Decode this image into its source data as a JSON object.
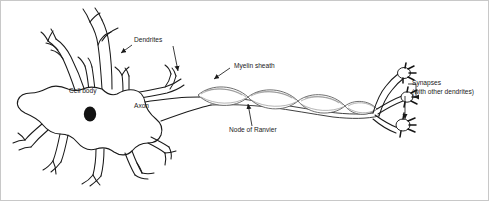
{
  "diagram": {
    "background_color": "#ffffff",
    "border_color": "#c8c8c8",
    "line_color": "#1a1a1a",
    "myelin_color": "#555555",
    "nucleus_color": "#121212",
    "width": 489,
    "height": 201
  },
  "labels": {
    "dendrites": "Dendrites",
    "cell_body": "Cell body",
    "axon": "Axon",
    "myelin_sheath": "Myelin sheath",
    "node_of_ranvier": "Node of Ranvier",
    "synapses": "Synapses",
    "synapses_sub": "(with other dendrites)"
  },
  "parts": [
    {
      "name": "dendrites",
      "label": "Dendrites",
      "description": "Branching processes radiating from the cell body"
    },
    {
      "name": "cell-body",
      "label": "Cell body",
      "description": "Soma containing the nucleus"
    },
    {
      "name": "nucleus",
      "label": "",
      "description": "Dark oval inside the cell body"
    },
    {
      "name": "axon",
      "label": "Axon",
      "description": "Long fiber conducting impulses away from the soma"
    },
    {
      "name": "myelin-sheath",
      "label": "Myelin sheath",
      "description": "Lens-shaped insulating segments wrapping the axon"
    },
    {
      "name": "node-of-ranvier",
      "label": "Node of Ranvier",
      "description": "Gap between adjacent myelin segments"
    },
    {
      "name": "synapses",
      "label": "Synapses",
      "description": "Terminal boutons contacting other dendrites"
    }
  ],
  "annotations": [
    {
      "name": "dendrites-annotation",
      "text": "Dendrites",
      "x": 133,
      "y": 41,
      "arrows": 2
    },
    {
      "name": "cell-body-annotation",
      "text": "Cell body",
      "x": 68,
      "y": 92,
      "arrows": 0
    },
    {
      "name": "axon-annotation",
      "text": "Axon",
      "x": 133,
      "y": 107,
      "arrows": 0
    },
    {
      "name": "myelin-sheath-annotation",
      "text": "Myelin sheath",
      "x": 233,
      "y": 67,
      "arrows": 1
    },
    {
      "name": "node-of-ranvier-annotation",
      "text": "Node of Ranvier",
      "x": 228,
      "y": 131,
      "arrows": 1
    },
    {
      "name": "synapses-annotation",
      "text": "Synapses",
      "x": 411,
      "y": 84,
      "arrows": 2
    },
    {
      "name": "synapses-sub-annotation",
      "text": "(with other dendrites)",
      "x": 411,
      "y": 93,
      "arrows": 0
    }
  ]
}
